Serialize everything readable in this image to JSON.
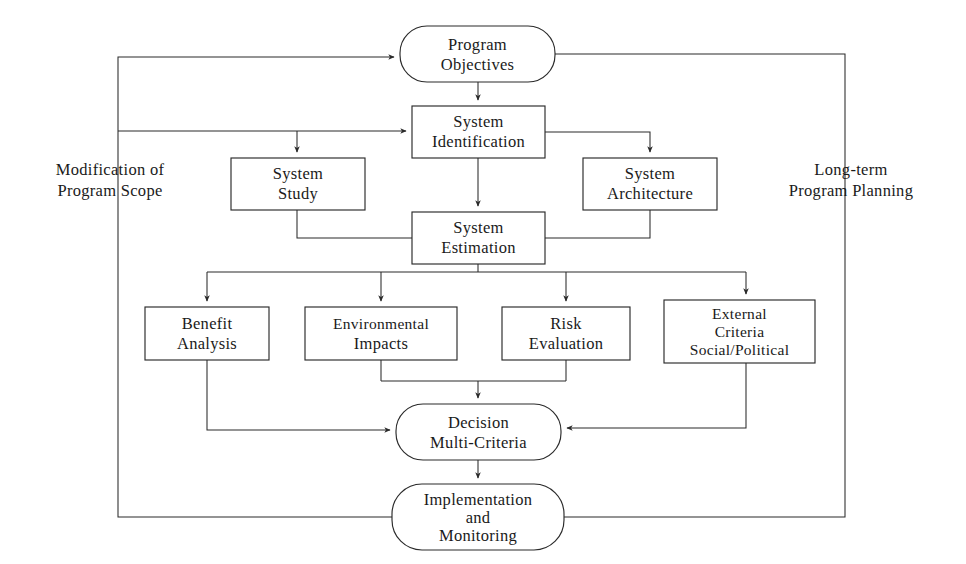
{
  "diagram": {
    "style": {
      "line_color": "#2a2a2a",
      "text_color": "#1a1a1a",
      "background": "#ffffff"
    },
    "nodes": [
      {
        "id": "program-objectives",
        "shape": "rounded",
        "lines": [
          "Program",
          "Objectives"
        ],
        "x": 400,
        "y": 26,
        "w": 155,
        "h": 56
      },
      {
        "id": "system-identification",
        "shape": "rect",
        "lines": [
          "System",
          "Identification"
        ],
        "x": 412,
        "y": 106,
        "w": 133,
        "h": 52
      },
      {
        "id": "system-study",
        "shape": "rect",
        "lines": [
          "System",
          "Study"
        ],
        "x": 231,
        "y": 158,
        "w": 134,
        "h": 52
      },
      {
        "id": "system-architecture",
        "shape": "rect",
        "lines": [
          "System",
          "Architecture"
        ],
        "x": 583,
        "y": 158,
        "w": 134,
        "h": 52
      },
      {
        "id": "system-estimation",
        "shape": "rect",
        "lines": [
          "System",
          "Estimation"
        ],
        "x": 412,
        "y": 212,
        "w": 133,
        "h": 52
      },
      {
        "id": "benefit-analysis",
        "shape": "rect",
        "lines": [
          "Benefit",
          "Analysis"
        ],
        "x": 145,
        "y": 307,
        "w": 124,
        "h": 53
      },
      {
        "id": "environmental-impacts",
        "shape": "rect",
        "lines": [
          "Environmental",
          "Impacts"
        ],
        "x": 305,
        "y": 307,
        "w": 152,
        "h": 53
      },
      {
        "id": "risk-evaluation",
        "shape": "rect",
        "lines": [
          "Risk",
          "Evaluation"
        ],
        "x": 502,
        "y": 307,
        "w": 128,
        "h": 53
      },
      {
        "id": "external-criteria",
        "shape": "rect",
        "lines": [
          "External",
          "Criteria",
          "Social/Political"
        ],
        "x": 664,
        "y": 300,
        "w": 151,
        "h": 63
      },
      {
        "id": "decision-multi-criteria",
        "shape": "rounded",
        "lines": [
          "Decision",
          "Multi-Criteria"
        ],
        "x": 396,
        "y": 404,
        "w": 165,
        "h": 56
      },
      {
        "id": "implementation-monitoring",
        "shape": "rounded",
        "lines": [
          "Implementation",
          "and",
          "Monitoring"
        ],
        "x": 392,
        "y": 484,
        "w": 172,
        "h": 66
      }
    ],
    "annotations": [
      {
        "id": "modification-of-program-scope",
        "lines": [
          "Modification of",
          "Program Scope"
        ],
        "x": 110,
        "y": 168
      },
      {
        "id": "long-term-program-planning",
        "lines": [
          "Long-term",
          "Program Planning"
        ],
        "x": 850,
        "y": 168
      }
    ],
    "edges": [
      {
        "id": "objectives-to-identification",
        "label": "Program Objectives to System Identification"
      },
      {
        "id": "identification-to-study",
        "label": "System Identification to System Study"
      },
      {
        "id": "identification-to-architecture",
        "label": "System Identification to System Architecture"
      },
      {
        "id": "study-to-estimation",
        "label": "System Study to System Estimation"
      },
      {
        "id": "architecture-to-estimation",
        "label": "System Architecture to System Estimation"
      },
      {
        "id": "identification-to-estimation",
        "label": "System Identification to System Estimation"
      },
      {
        "id": "estimation-fanout",
        "label": "System Estimation to four criteria nodes"
      },
      {
        "id": "benefit-to-decision",
        "label": "Benefit Analysis to Decision Multi-Criteria"
      },
      {
        "id": "environmental-risk-to-decision",
        "label": "Environmental Impacts and Risk Evaluation to Decision"
      },
      {
        "id": "external-to-decision",
        "label": "External Criteria to Decision Multi-Criteria"
      },
      {
        "id": "decision-to-implementation",
        "label": "Decision Multi-Criteria to Implementation and Monitoring"
      },
      {
        "id": "modification-feedback-loop",
        "label": "Modification of Program Scope feedback loop"
      },
      {
        "id": "long-term-feedback-loop",
        "label": "Long-term Program Planning feedback loop"
      }
    ]
  }
}
